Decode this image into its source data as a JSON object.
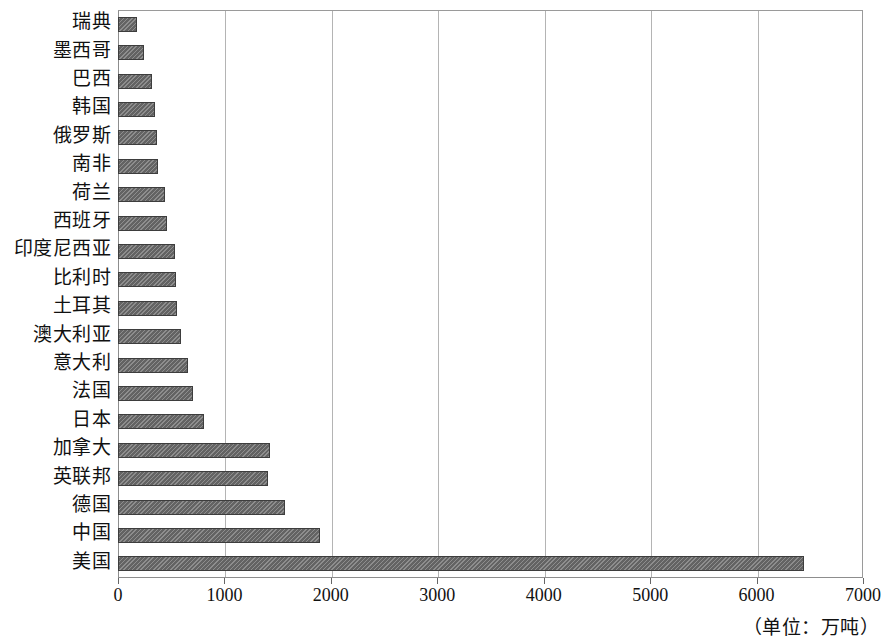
{
  "chart_data": {
    "type": "bar",
    "orientation": "horizontal",
    "title": "",
    "subtitle": "",
    "xlabel": "",
    "ylabel": "",
    "unit_note": "（单位：万吨）",
    "xlim": [
      0,
      7000
    ],
    "xticks": [
      0,
      1000,
      2000,
      3000,
      4000,
      5000,
      6000,
      7000
    ],
    "xtick_labels": [
      "0",
      "1000",
      "2000",
      "3000",
      "4000",
      "5000",
      "6000",
      "7000"
    ],
    "grid": true,
    "grid_axis": "x",
    "legend": false,
    "legend_position": "none",
    "bar_color": "#6e6e6e",
    "bar_edge_color": "#3d3d3d",
    "grid_color": "#b4b4b4",
    "axis_color": "#8d8d8d",
    "categories": [
      "瑞典",
      "墨西哥",
      "巴西",
      "韩国",
      "俄罗斯",
      "南非",
      "荷兰",
      "西班牙",
      "印度尼西亚",
      "比利时",
      "土耳其",
      "澳大利亚",
      "意大利",
      "法国",
      "日本",
      "加拿大",
      "英联邦",
      "德国",
      "中国",
      "美国"
    ],
    "values": [
      180,
      240,
      320,
      350,
      370,
      380,
      440,
      460,
      540,
      545,
      555,
      590,
      660,
      700,
      810,
      1430,
      1410,
      1570,
      1900,
      6450
    ]
  }
}
